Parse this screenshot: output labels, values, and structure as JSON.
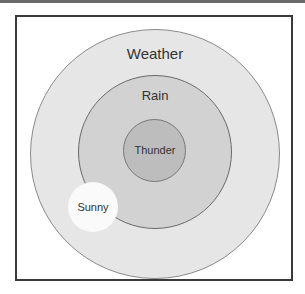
{
  "diagram": {
    "type": "nested-circles",
    "nodes": [
      {
        "id": "weather",
        "label": "Weather",
        "color": "#e6e6e6",
        "stroke": "#8a8a8a"
      },
      {
        "id": "rain",
        "label": "Rain",
        "color": "#d2d2d2",
        "stroke": "#6a6a6a",
        "parent": "weather"
      },
      {
        "id": "thunder",
        "label": "Thunder",
        "color": "#bdbdbd",
        "stroke": "#777777",
        "parent": "rain"
      },
      {
        "id": "sunny",
        "label": "Sunny",
        "color": "#fafafa",
        "stroke": "#fafafa",
        "parent": "weather"
      }
    ]
  }
}
